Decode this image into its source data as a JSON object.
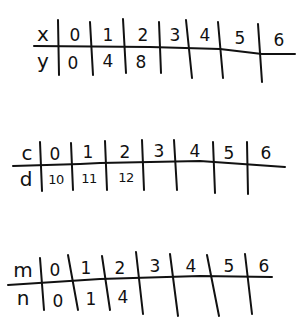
{
  "tables": [
    {
      "input_label": "x",
      "output_label": "y",
      "inputs": [
        "0",
        "1",
        "2",
        "3",
        "4",
        "5",
        "6"
      ],
      "outputs": [
        "0",
        "4",
        "8",
        "",
        "",
        "",
        ""
      ]
    },
    {
      "input_label": "c",
      "output_label": "d",
      "inputs": [
        "0",
        "1",
        "2",
        "3",
        "4",
        "5",
        "6"
      ],
      "outputs": [
        "10",
        "11",
        "12",
        "",
        "",
        "",
        ""
      ]
    },
    {
      "input_label": "m",
      "output_label": "n",
      "inputs": [
        "0",
        "1",
        "2",
        "3",
        "4",
        "5",
        "6"
      ],
      "outputs": [
        "0",
        "1",
        "4",
        "",
        "",
        "",
        ""
      ]
    }
  ],
  "ink_color": "#111111"
}
